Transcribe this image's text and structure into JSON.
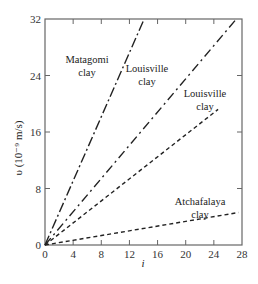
{
  "chart_data": {
    "type": "line",
    "title": "",
    "xlabel": "i",
    "ylabel": "υ (10⁻⁹ m/s)",
    "xlim": [
      0,
      28
    ],
    "ylim": [
      0,
      32
    ],
    "xticks": [
      0,
      4,
      8,
      12,
      16,
      20,
      24,
      28
    ],
    "yticks": [
      0,
      8,
      16,
      24,
      32
    ],
    "grid": false,
    "legend": "none (inline annotations)",
    "series": [
      {
        "name": "Matagomi clay",
        "x": [
          0,
          14.1
        ],
        "y": [
          0,
          32
        ],
        "label_line1": "Matagomi",
        "label_line2": "clay"
      },
      {
        "name": "Louisville clay (upper)",
        "x": [
          0,
          27.2
        ],
        "y": [
          0,
          32
        ],
        "label_line1": "Louisville",
        "label_line2": "clay"
      },
      {
        "name": "Louisville clay (lower)",
        "x": [
          0,
          24.6
        ],
        "y": [
          0,
          19.2
        ],
        "label_line1": "Louisville",
        "label_line2": "clay"
      },
      {
        "name": "Atchafalaya clay",
        "x": [
          0,
          27.5
        ],
        "y": [
          0,
          4.6
        ],
        "label_line1": "Atchafalaya",
        "label_line2": "clay"
      }
    ]
  }
}
